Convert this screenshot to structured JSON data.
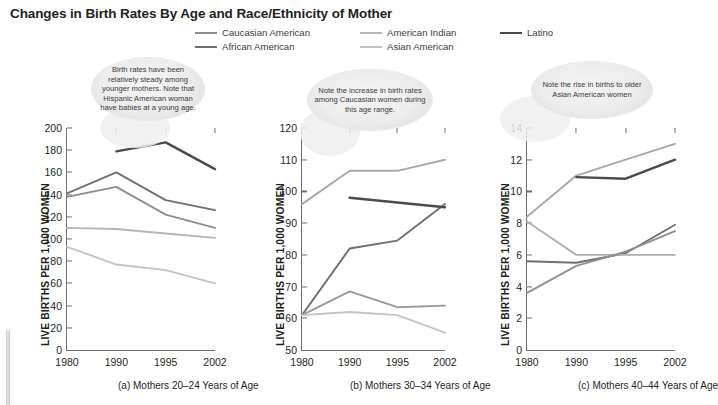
{
  "title": "Changes in Birth Rates By Age and Race/Ethnicity of Mother",
  "legend": {
    "position": "top-center",
    "items": [
      {
        "label": "Caucasian American",
        "color": "#8d8d8d"
      },
      {
        "label": "African American",
        "color": "#707070"
      },
      {
        "label": "American Indian",
        "color": "#b5b5b5"
      },
      {
        "label": "Asian American",
        "color": "#c3c3c3"
      },
      {
        "label": "Latino",
        "color": "#4a4a4a"
      }
    ]
  },
  "annotations": [
    {
      "text": "Birth rates have been relatively steady among younger mothers. Note that Hispanic American woman have babies at a young age."
    },
    {
      "text": "Note the increase in birth rates among Caucasian women during this age range."
    },
    {
      "text": "Note the rise in births to older Asian American women"
    }
  ],
  "captions": [
    "(a) Mothers 20–24 Years of Age",
    "(b) Mothers 30–34 Years of Age",
    "(c) Mothers 40–44 Years of Age"
  ],
  "ylabel": "LIVE BIRTHS PER 1,000 WOMEN",
  "chart_data": [
    {
      "type": "line",
      "title": "(a) Mothers 20–24 Years of Age",
      "xlabel": "",
      "ylabel": "LIVE BIRTHS PER 1,000 WOMEN",
      "x": [
        1980,
        1990,
        1995,
        2002
      ],
      "xticklabels": [
        "1980",
        "1990",
        "1995",
        "2002"
      ],
      "ylim": [
        0,
        200
      ],
      "yticks": [
        0,
        20,
        40,
        60,
        80,
        100,
        120,
        140,
        160,
        180,
        200
      ],
      "grid": false,
      "series": [
        {
          "name": "Caucasian American",
          "color": "#8d8d8d",
          "x": [
            1980,
            1990,
            1995,
            2002
          ],
          "values": [
            138,
            147,
            122,
            110
          ]
        },
        {
          "name": "African American",
          "color": "#707070",
          "x": [
            1980,
            1990,
            1995,
            2002
          ],
          "values": [
            141,
            160,
            135,
            126
          ]
        },
        {
          "name": "American Indian",
          "color": "#b5b5b5",
          "x": [
            1980,
            1990,
            1995,
            2002
          ],
          "values": [
            110,
            109,
            105,
            101
          ]
        },
        {
          "name": "Asian American",
          "color": "#c3c3c3",
          "x": [
            1980,
            1990,
            1995,
            2002
          ],
          "values": [
            93,
            77,
            72,
            60
          ]
        },
        {
          "name": "Latino",
          "color": "#4a4a4a",
          "x": [
            1990,
            1995,
            2002
          ],
          "values": [
            179,
            187,
            163
          ]
        }
      ]
    },
    {
      "type": "line",
      "title": "(b) Mothers 30–34 Years of Age",
      "xlabel": "",
      "ylabel": "LIVE BIRTHS PER 1,000 WOMEN",
      "x": [
        1980,
        1990,
        1995,
        2002
      ],
      "xticklabels": [
        "1980",
        "1990",
        "1995",
        "2002"
      ],
      "ylim": [
        50,
        120
      ],
      "yticks": [
        50,
        60,
        70,
        80,
        90,
        100,
        110,
        120
      ],
      "grid": false,
      "series": [
        {
          "name": "Caucasian American",
          "color": "#a8a8a8",
          "x": [
            1980,
            1990,
            1995,
            2002
          ],
          "values": [
            96,
            106.5,
            106.5,
            110
          ]
        },
        {
          "name": "African American",
          "color": "#707070",
          "x": [
            1980,
            1990,
            1995,
            2002
          ],
          "values": [
            61,
            82,
            84.5,
            96
          ]
        },
        {
          "name": "American Indian",
          "color": "#9a9a9a",
          "x": [
            1980,
            1990,
            1995,
            2002
          ],
          "values": [
            61,
            68.5,
            63.5,
            64
          ]
        },
        {
          "name": "Asian American",
          "color": "#c3c3c3",
          "x": [
            1980,
            1990,
            1995,
            2002
          ],
          "values": [
            61,
            62,
            61,
            55.5
          ]
        },
        {
          "name": "Latino",
          "color": "#4a4a4a",
          "x": [
            1990,
            1995,
            2002
          ],
          "values": [
            98,
            96.5,
            95
          ]
        }
      ]
    },
    {
      "type": "line",
      "title": "(c) Mothers 40–44 Years of Age",
      "xlabel": "",
      "ylabel": "LIVE BIRTHS PER 1,000 WOMEN",
      "x": [
        1980,
        1990,
        1995,
        2002
      ],
      "xticklabels": [
        "1980",
        "1990",
        "1995",
        "2002"
      ],
      "ylim": [
        0,
        14
      ],
      "yticks": [
        0,
        2,
        4,
        6,
        8,
        10,
        12,
        14
      ],
      "grid": false,
      "series": [
        {
          "name": "Caucasian American",
          "color": "#a8a8a8",
          "x": [
            1980,
            1990,
            1995,
            2002
          ],
          "values": [
            8.4,
            11.0,
            12.0,
            13.0
          ]
        },
        {
          "name": "African American",
          "color": "#707070",
          "x": [
            1980,
            1990,
            1995,
            2002
          ],
          "values": [
            5.6,
            5.5,
            6.1,
            7.9
          ]
        },
        {
          "name": "American Indian",
          "color": "#b0b0b0",
          "x": [
            1980,
            1990,
            1995,
            2002
          ],
          "values": [
            8.1,
            6.0,
            6.0,
            6.0
          ]
        },
        {
          "name": "Asian American",
          "color": "#8f8f8f",
          "x": [
            1980,
            1990,
            1995,
            2002
          ],
          "values": [
            3.6,
            5.3,
            6.2,
            7.5
          ]
        },
        {
          "name": "Latino",
          "color": "#4a4a4a",
          "x": [
            1990,
            1995,
            2002
          ],
          "values": [
            10.9,
            10.8,
            12.0
          ]
        }
      ]
    }
  ]
}
